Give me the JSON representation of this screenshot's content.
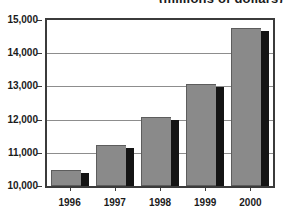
{
  "chart_data": {
    "type": "bar",
    "title": "(millions of dollars)",
    "xlabel": "",
    "ylabel": "",
    "categories": [
      "1996",
      "1997",
      "1998",
      "1999",
      "2000"
    ],
    "values": [
      10470,
      11240,
      12090,
      13080,
      14750
    ],
    "ylim": [
      10000,
      15000
    ],
    "ytick_labels": [
      "10,000",
      "11,000",
      "12,000",
      "13,000",
      "14,000",
      "15,000"
    ],
    "ytick_values": [
      10000,
      11000,
      12000,
      13000,
      14000,
      15000
    ],
    "grid": true,
    "legend": false,
    "bar_color": "#8a8a8a",
    "bar_shadow_color": "#141414",
    "axis_color": "#3b3b3b",
    "gridline_color": "#8d8d8d",
    "background": "#ffffff"
  }
}
